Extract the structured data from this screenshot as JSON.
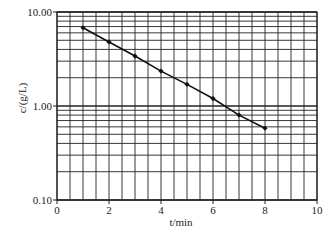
{
  "chart_data": {
    "type": "line",
    "title": "",
    "xlabel": "t/min",
    "ylabel": "c/(g/L)",
    "yscale": "log",
    "xlim": [
      0,
      10
    ],
    "ylim": [
      0.1,
      10
    ],
    "grid": true,
    "legend": null,
    "x_ticks": [
      0,
      2,
      4,
      6,
      8,
      10
    ],
    "x_tick_labels": [
      "0",
      "2",
      "4",
      "6",
      "8",
      "10"
    ],
    "y_ticks": [
      0.1,
      1,
      10
    ],
    "y_tick_labels": [
      "0.10",
      "1.00",
      "10.00"
    ],
    "x_minor_step": 0.5,
    "series": [
      {
        "name": "c",
        "x": [
          1,
          2,
          3,
          4,
          5,
          6,
          7,
          8
        ],
        "values": [
          6.8,
          4.8,
          3.4,
          2.35,
          1.7,
          1.2,
          0.8,
          0.58
        ],
        "marker": "diamond",
        "color": "#111111"
      }
    ]
  },
  "style": {
    "grid_color": "#222222",
    "line_color": "#111111",
    "plot_box": {
      "left": 57,
      "top": 12,
      "right": 317,
      "bottom": 200
    }
  }
}
